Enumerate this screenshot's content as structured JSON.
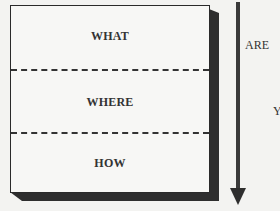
{
  "diagram": {
    "type": "layered-box",
    "sections": [
      {
        "label": "WHAT"
      },
      {
        "label": "WHERE"
      },
      {
        "label": "HOW"
      }
    ],
    "divider_style": "dashed",
    "arrow": {
      "direction": "down"
    },
    "side_labels": [
      {
        "text": "ARE"
      },
      {
        "text": "Y"
      }
    ]
  },
  "colors": {
    "background": "#f3f3f1",
    "stroke": "#2a2a2a",
    "shadow": "#2e2e2e"
  }
}
